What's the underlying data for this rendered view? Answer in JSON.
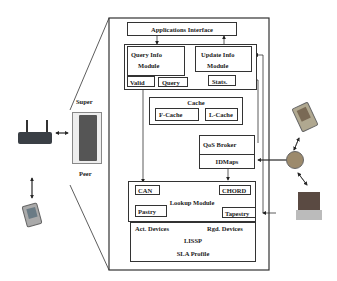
{
  "diagram": {
    "peer_labels": {
      "top": "Super",
      "bottom": "Peer"
    },
    "apps_interface": "Applications Interface",
    "query_info": {
      "line1": "Query Info",
      "line2": "Module",
      "sub": [
        "Valid",
        "Query"
      ]
    },
    "update_info": {
      "line1": "Update Info",
      "line2": "Module",
      "sub": [
        "Stats."
      ]
    },
    "cache": {
      "title": "Cache",
      "items": [
        "F-Cache",
        "L-Cache"
      ]
    },
    "qos_broker": "QoS Broker",
    "idmaps": "IDMaps",
    "lookup": {
      "title": "Lookup Module",
      "items": [
        "CAN",
        "CHORD",
        "Pastry",
        "Tapestry"
      ]
    },
    "lissp": {
      "left": "Act. Devices",
      "right": "Rgd. Devices",
      "center": "LISSP",
      "bottom": "SLA Profile"
    },
    "devices": [
      "wireless-router",
      "pda-left",
      "server-tower",
      "pda-right",
      "globe-hub",
      "laptop"
    ]
  }
}
